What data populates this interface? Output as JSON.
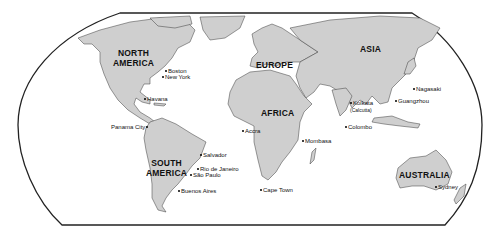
{
  "map": {
    "projection": "Robinson",
    "colors": {
      "land": "#cfcfcf",
      "border": "#3a3a3a",
      "ocean": "#ffffff",
      "frame": "#222222"
    },
    "continents": [
      {
        "id": "north-america",
        "label": "NORTH\nAMERICA",
        "line1": "NORTH",
        "line2": "AMERICA"
      },
      {
        "id": "south-america",
        "label": "SOUTH\nAMERICA",
        "line1": "SOUTH",
        "line2": "AMERICA"
      },
      {
        "id": "europe",
        "label": "EUROPE"
      },
      {
        "id": "africa",
        "label": "AFRICA"
      },
      {
        "id": "asia",
        "label": "ASIA"
      },
      {
        "id": "australia",
        "label": "AUSTRALIA"
      }
    ],
    "cities": [
      {
        "name": "Boston"
      },
      {
        "name": "New York"
      },
      {
        "name": "Havana"
      },
      {
        "name": "Panama City"
      },
      {
        "name": "Salvador"
      },
      {
        "name": "Rio de Janeiro"
      },
      {
        "name": "São Paulo"
      },
      {
        "name": "Buenos Aires"
      },
      {
        "name": "Accra"
      },
      {
        "name": "Mombasa"
      },
      {
        "name": "Cape Town"
      },
      {
        "name": "Kolkata",
        "note": "(Calcutta)"
      },
      {
        "name": "Colombo"
      },
      {
        "name": "Guangzhou"
      },
      {
        "name": "Nagasaki"
      },
      {
        "name": "Sydney"
      }
    ]
  }
}
